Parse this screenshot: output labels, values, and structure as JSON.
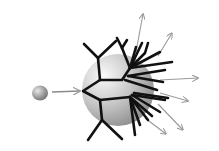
{
  "diagram": {
    "type": "schematic",
    "colors": {
      "background": "#ffffff",
      "branch": "#111111",
      "arrow": "#9a9a9a",
      "sphere_light": "#f2f2f2",
      "sphere_dark": "#8c8c8c"
    },
    "nodes": [
      {
        "id": "small-sphere",
        "shape": "sphere",
        "cx": 40,
        "cy": 93,
        "r": 8
      },
      {
        "id": "large-sphere",
        "shape": "sphere",
        "cx": 118,
        "cy": 90,
        "r": 36
      },
      {
        "id": "dendritic-branches",
        "shape": "branching-lines",
        "root": [
          83,
          91
        ]
      }
    ],
    "edges": [
      {
        "from": "small-sphere",
        "to": "large-sphere",
        "style": "gray-arrow"
      }
    ],
    "output_arrows": 7
  }
}
